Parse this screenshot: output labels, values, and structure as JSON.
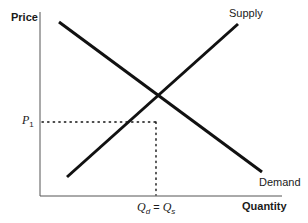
{
  "diagram": {
    "y_axis_label": "Price",
    "x_axis_label": "Quantity",
    "curves": [
      {
        "name": "Supply",
        "label": "Supply",
        "from": [
          67,
          177
        ],
        "to": [
          238,
          24
        ]
      },
      {
        "name": "Demand",
        "label": "Demand",
        "from": [
          59,
          22
        ],
        "to": [
          262,
          172
        ]
      }
    ],
    "equilibrium": {
      "price_label_base": "P",
      "price_label_sub": "1",
      "quantity_label_d": "Q",
      "quantity_sub_d": "d",
      "equals": " = ",
      "quantity_label_s": "Q",
      "quantity_sub_s": "s",
      "point": [
        156,
        122
      ]
    },
    "colors": {
      "line": "#111111",
      "axis": "#333333",
      "text": "#1a1a1a"
    }
  }
}
